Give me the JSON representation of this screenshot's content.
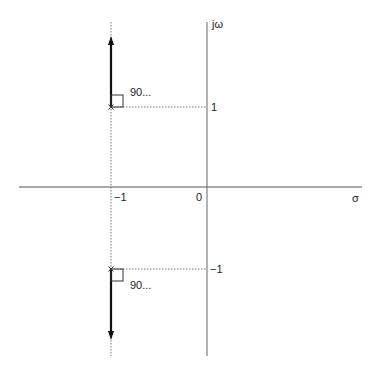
{
  "diagram": {
    "type": "s-plane pole plot",
    "axes": {
      "horizontal_label": "σ",
      "vertical_label": "jω",
      "origin_label": "0"
    },
    "ticks": {
      "real_minus_one": "−1",
      "imag_plus_one": "1",
      "imag_minus_one": "−1"
    },
    "poles": [
      {
        "real": -1,
        "imag": 1,
        "marker": "×",
        "angle_label": "90..."
      },
      {
        "real": -1,
        "imag": -1,
        "marker": "×",
        "angle_label": "90..."
      }
    ],
    "colors": {
      "axis": "#555555",
      "arrow": "#111111",
      "dotted": "#777777"
    }
  }
}
